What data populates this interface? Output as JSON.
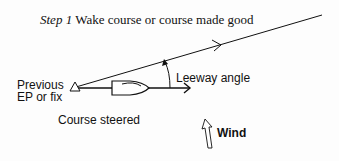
{
  "title": {
    "step": "Step 1",
    "text": "Wake course or course made good"
  },
  "labels": {
    "previous_line1": "Previous",
    "previous_line2": "EP or fix",
    "leeway": "Leeway angle",
    "course_steered": "Course steered",
    "wind": "Wind"
  },
  "colors": {
    "ink": "#111111",
    "background": "#fdfdfd"
  }
}
